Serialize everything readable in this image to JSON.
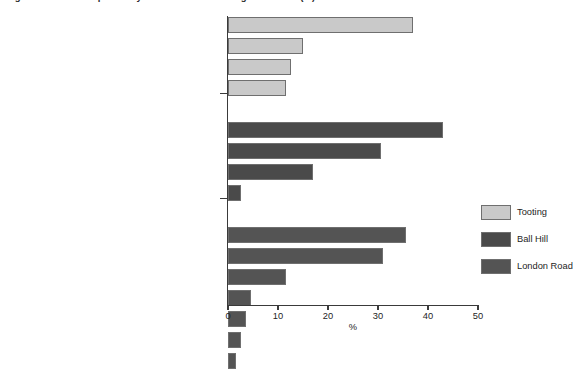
{
  "chart_data": {
    "type": "bar",
    "orientation": "horizontal",
    "title": "Figure: Problems reported by residents in each neighbourhood (%)",
    "xlabel": "%",
    "ylabel": "",
    "xlim": [
      0,
      50
    ],
    "xticks": [
      0,
      10,
      20,
      30,
      40,
      50
    ],
    "xtick_labels": [
      "0",
      "10",
      "20",
      "30",
      "40",
      "50"
    ],
    "grid": false,
    "legend_position": "right",
    "series": [
      {
        "name": "Tooting",
        "color": "#c9c9c9",
        "categories": [
          "Groups of kids/young people hanging around",
          "A general feeling of unease at night",
          "Street crime/fear of crime",
          "Drunks/drug addicts"
        ],
        "values": [
          37,
          15,
          12.5,
          11.5
        ]
      },
      {
        "name": "Ball Hill",
        "color": "#4a4a4a",
        "categories": [
          "Groups of kids/young people hanging around",
          "Street crime/fear of crime",
          "Drunks/drug addicts",
          "Prostitutes"
        ],
        "values": [
          43,
          30.5,
          17,
          2.5
        ]
      },
      {
        "name": "London Road",
        "color": "#545454",
        "categories": [
          "Drunks/drug addicts",
          "Groups of kids/young people hanging around",
          "A general feeling of unease at night",
          "Football crowds",
          "Street crime/fear of crime",
          "Traffic",
          "General antisocial behaviour"
        ],
        "values": [
          35.5,
          31,
          11.5,
          4.5,
          3.5,
          2.5,
          1.5
        ]
      }
    ]
  },
  "legend": {
    "items": [
      {
        "label": "Tooting",
        "color": "#c9c9c9"
      },
      {
        "label": "Ball Hill",
        "color": "#4a4a4a"
      },
      {
        "label": "London Road",
        "color": "#545454"
      }
    ]
  },
  "axis": {
    "x_label": "%"
  }
}
